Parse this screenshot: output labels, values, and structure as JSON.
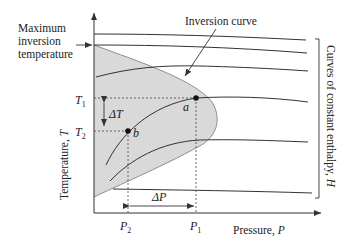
{
  "labels": {
    "max_inversion": [
      "Maximum",
      "inversion",
      "temperature"
    ],
    "inversion_curve": "Inversion curve",
    "y_axis": "Temperature, ",
    "y_axis_var": "T",
    "x_axis": "Pressure, ",
    "x_axis_var": "P",
    "enthalpy_bracket": "Curves of constant enthalpy, ",
    "enthalpy_var": "H",
    "T1": "T",
    "T1_sub": "1",
    "T2": "T",
    "T2_sub": "2",
    "P1": "P",
    "P1_sub": "1",
    "P2": "P",
    "P2_sub": "2",
    "delta_T": "ΔT",
    "delta_P": "ΔP",
    "point_a": "a",
    "point_b": "b"
  },
  "colors": {
    "shade": "#d9d9d9",
    "line": "#333333",
    "text": "#222222"
  }
}
